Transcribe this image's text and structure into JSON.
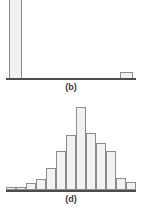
{
  "chart_data": [
    {
      "id": "b",
      "type": "bar",
      "title": "(b)",
      "caption": "(b)",
      "xlabel": "",
      "ylabel": "",
      "grid": false,
      "legend": null,
      "axis_color": "#4d4d4d",
      "bar_fill": "#f2f2f2",
      "bar_stroke": "#8c8c8c",
      "note": "Extremely right-skewed / bimodal-at-extremes distribution: one dominant bar at the far left that is clipped by the top edge of the figure, and one very small bar near the far right.",
      "categories": [
        "1",
        "2",
        "3",
        "4",
        "5",
        "6",
        "7",
        "8",
        "9",
        "10"
      ],
      "values": [
        100,
        0,
        0,
        0,
        0,
        0,
        0,
        0,
        0,
        8
      ],
      "ylim": [
        0,
        100
      ],
      "bars": [
        {
          "category": "1",
          "value": 100,
          "left_pct": 6.0,
          "width_pct": 9.5,
          "height_pct": 100,
          "clipped": true
        },
        {
          "category": "10",
          "value": 8,
          "left_pct": 84.5,
          "width_pct": 9.5,
          "height_pct": 10,
          "clipped": false
        }
      ]
    },
    {
      "id": "d",
      "type": "bar",
      "title": "(d)",
      "caption": "(d)",
      "xlabel": "",
      "ylabel": "",
      "grid": false,
      "legend": null,
      "axis_color": "#4d4d4d",
      "bar_fill": "#f2f2f2",
      "bar_stroke": "#8c8c8c",
      "note": "Approximately symmetric, bell-shaped (mound-shaped) distribution centred slightly left of middle.",
      "categories": [
        "1",
        "2",
        "3",
        "4",
        "5",
        "6",
        "7",
        "8",
        "9",
        "10",
        "11",
        "12",
        "13"
      ],
      "values": [
        2,
        1,
        5,
        10,
        23,
        42,
        62,
        89,
        55,
        48,
        38,
        11,
        7
      ],
      "ylim": [
        0,
        100
      ],
      "bars": [
        {
          "category": "1",
          "value": 2,
          "left_pct": 4.5,
          "width_pct": 7.0,
          "height_pct": 3
        },
        {
          "category": "2",
          "value": 1,
          "left_pct": 11.5,
          "width_pct": 7.0,
          "height_pct": 3
        },
        {
          "category": "3",
          "value": 5,
          "left_pct": 18.5,
          "width_pct": 7.0,
          "height_pct": 8
        },
        {
          "category": "4",
          "value": 10,
          "left_pct": 25.5,
          "width_pct": 7.0,
          "height_pct": 13
        },
        {
          "category": "5",
          "value": 23,
          "left_pct": 32.5,
          "width_pct": 7.0,
          "height_pct": 26
        },
        {
          "category": "6",
          "value": 42,
          "left_pct": 39.5,
          "width_pct": 7.0,
          "height_pct": 45
        },
        {
          "category": "7",
          "value": 62,
          "left_pct": 46.5,
          "width_pct": 7.0,
          "height_pct": 64
        },
        {
          "category": "8",
          "value": 89,
          "left_pct": 53.5,
          "width_pct": 7.0,
          "height_pct": 97
        },
        {
          "category": "9",
          "value": 55,
          "left_pct": 60.5,
          "width_pct": 7.0,
          "height_pct": 66
        },
        {
          "category": "10",
          "value": 48,
          "left_pct": 67.5,
          "width_pct": 7.0,
          "height_pct": 55
        },
        {
          "category": "11",
          "value": 38,
          "left_pct": 74.5,
          "width_pct": 7.0,
          "height_pct": 45
        },
        {
          "category": "12",
          "value": 11,
          "left_pct": 81.5,
          "width_pct": 7.0,
          "height_pct": 14
        },
        {
          "category": "13",
          "value": 7,
          "left_pct": 88.5,
          "width_pct": 7.0,
          "height_pct": 9
        }
      ]
    }
  ]
}
